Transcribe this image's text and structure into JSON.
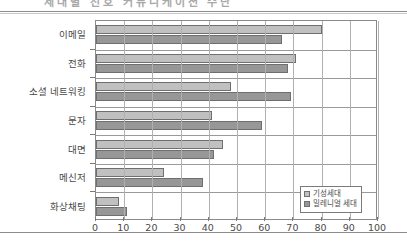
{
  "page": {
    "title_fragment": "세대별 선호 커뮤니케이션 수단"
  },
  "legend": {
    "position": "inside-bottom-right",
    "items": [
      {
        "label": "기성세대",
        "color": "#c0c0c0"
      },
      {
        "label": "밀레니얼 세대",
        "color": "#979797"
      }
    ]
  },
  "axis": {
    "x_ticks": [
      "0",
      "10",
      "20",
      "30",
      "40",
      "50",
      "60",
      "70",
      "80",
      "90",
      "100"
    ]
  },
  "chart_data": {
    "type": "bar",
    "orientation": "horizontal",
    "title": "",
    "xlabel": "",
    "ylabel": "",
    "xlim": [
      0,
      100
    ],
    "xtick_step": 10,
    "grid": true,
    "legend_position": "inside-bottom-right",
    "categories": [
      "이메일",
      "전화",
      "소셜 네트워킹",
      "문자",
      "대면",
      "메신저",
      "화상채팅"
    ],
    "series": [
      {
        "name": "기성세대",
        "color": "#c0c0c0",
        "values": [
          80,
          71,
          48,
          41,
          45,
          24,
          8
        ]
      },
      {
        "name": "밀레니얼 세대",
        "color": "#979797",
        "values": [
          66,
          68,
          69,
          59,
          42,
          38,
          11
        ]
      }
    ]
  }
}
